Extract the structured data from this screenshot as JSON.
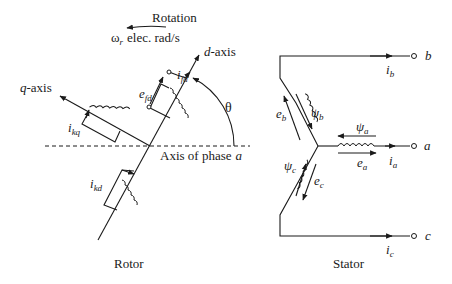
{
  "rotor": {
    "rotation_label": "Rotation",
    "omega_symbol": "ω",
    "omega_sub": "r",
    "omega_unit": "elec. rad/s",
    "d_axis_italic": "d",
    "d_axis_rest": "-axis",
    "q_axis_italic": "q",
    "q_axis_rest": "-axis",
    "theta": "θ",
    "phase_axis_label": "Axis of phase",
    "phase_axis_letter": "a",
    "ifd_main": "i",
    "ifd_sub": "fd",
    "efd_main": "e",
    "efd_sub": "fd",
    "ikq_main": "i",
    "ikq_sub": "kq",
    "ikd_main": "i",
    "ikd_sub": "kd",
    "caption": "Rotor"
  },
  "stator": {
    "terminal_b": "b",
    "terminal_a": "a",
    "terminal_c": "c",
    "ib_main": "i",
    "ib_sub": "b",
    "ia_main": "i",
    "ia_sub": "a",
    "ic_main": "i",
    "ic_sub": "c",
    "eb_main": "e",
    "eb_sub": "b",
    "ea_main": "e",
    "ea_sub": "a",
    "ec_main": "e",
    "ec_sub": "c",
    "psib_main": "ψ",
    "psib_sub": "b",
    "psia_main": "ψ",
    "psia_sub": "a",
    "psic_main": "ψ",
    "psic_sub": "c",
    "caption": "Stator"
  }
}
